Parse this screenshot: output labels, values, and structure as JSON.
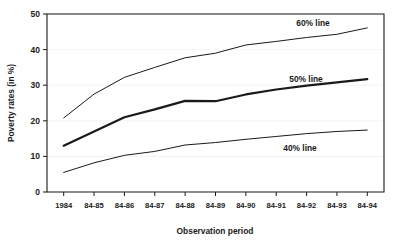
{
  "chart_data": {
    "type": "line",
    "title": "",
    "xlabel": "Observation period",
    "ylabel": "Poverty rates (in %)",
    "categories": [
      "1984",
      "84-85",
      "84-86",
      "84-87",
      "84-88",
      "84-89",
      "84-90",
      "84-91",
      "84-92",
      "84-93",
      "84-94"
    ],
    "ylim": [
      0,
      50
    ],
    "yticks": [
      "0",
      "10",
      "20",
      "30",
      "40",
      "50"
    ],
    "ytick_values": [
      0,
      10,
      20,
      30,
      40,
      50
    ],
    "grid": true,
    "legend_position": "inline-annotations",
    "series": [
      {
        "name": "60% line",
        "label": "60% line",
        "values": [
          20.8,
          27.5,
          32.2,
          35.0,
          37.7,
          39.0,
          41.3,
          42.3,
          43.4,
          44.3,
          46.1
        ],
        "color": "#1a1a1a",
        "linewidth": 1.0
      },
      {
        "name": "50% line",
        "label": "50% line",
        "values": [
          13.0,
          17.0,
          21.0,
          23.2,
          25.6,
          25.5,
          27.4,
          28.8,
          29.9,
          30.8,
          31.7
        ],
        "color": "#1a1a1a",
        "linewidth": 2.2
      },
      {
        "name": "40% line",
        "label": "40% line",
        "values": [
          5.5,
          8.2,
          10.3,
          11.4,
          13.2,
          13.9,
          14.8,
          15.6,
          16.4,
          17.0,
          17.4
        ],
        "color": "#1a1a1a",
        "linewidth": 1.0
      }
    ],
    "annotations": [
      {
        "text": "60% line",
        "x": 313,
        "y": 26
      },
      {
        "text": "50% line",
        "x": 306,
        "y": 82
      },
      {
        "text": "40% line",
        "x": 300,
        "y": 151
      }
    ]
  }
}
